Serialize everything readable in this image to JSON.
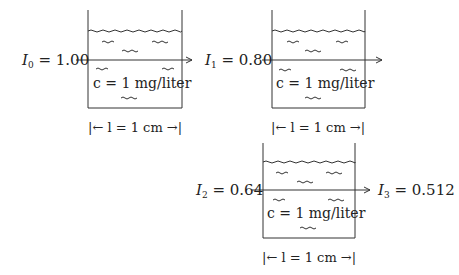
{
  "cells": [
    {
      "in_sym": "I",
      "in_sub": "0",
      "in_val": "= 1.00",
      "conc": "c = 1 mg/liter",
      "length": "|← l = 1 cm →|"
    },
    {
      "in_sym": "I",
      "in_sub": "1",
      "in_val": "= 0.80",
      "conc": "c = 1 mg/liter",
      "length": "|← l = 1 cm →|"
    },
    {
      "in_sym": "I",
      "in_sub": "2",
      "in_val": "= 0.64",
      "conc": "c = 1 mg/liter",
      "length": "|← l = 1 cm →|",
      "out_sym": "I",
      "out_sub": "3",
      "out_val": "= 0.512"
    }
  ]
}
